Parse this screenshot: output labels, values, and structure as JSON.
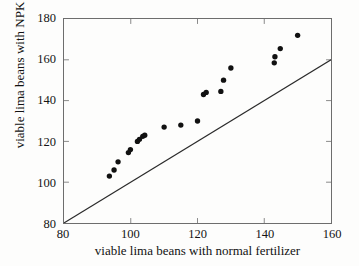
{
  "chart_data": {
    "type": "scatter",
    "title": "",
    "xlabel": "viable lima beans with normal fertilizer",
    "ylabel": "viable lima beans with NPK fertilizer",
    "xlim": [
      80,
      160
    ],
    "ylim": [
      80,
      180
    ],
    "xticks": [
      80,
      100,
      120,
      140,
      160
    ],
    "yticks": [
      80,
      100,
      120,
      140,
      160,
      180
    ],
    "grid": false,
    "legend": null,
    "marker": {
      "shape": "circle",
      "color": "#111111",
      "size": 5.4
    },
    "series": [
      {
        "name": "paired lima bean counts",
        "points": [
          [
            93.6,
            103.0
          ],
          [
            95.0,
            106.0
          ],
          [
            96.2,
            110.0
          ],
          [
            99.3,
            114.5
          ],
          [
            99.9,
            116.0
          ],
          [
            102.0,
            120.0
          ],
          [
            102.6,
            121.0
          ],
          [
            103.6,
            122.5
          ],
          [
            104.2,
            123.0
          ],
          [
            110.0,
            127.0
          ],
          [
            115.0,
            128.0
          ],
          [
            120.0,
            130.0
          ],
          [
            121.8,
            143.0
          ],
          [
            122.6,
            144.0
          ],
          [
            127.0,
            144.5
          ],
          [
            127.8,
            150.0
          ],
          [
            130.0,
            156.0
          ],
          [
            143.0,
            158.5
          ],
          [
            143.2,
            161.5
          ],
          [
            144.8,
            165.5
          ],
          [
            150.0,
            172.0
          ]
        ]
      }
    ],
    "reference_line": {
      "label": "y = x identity line",
      "from": [
        80,
        80
      ],
      "to": [
        160,
        160
      ],
      "color": "#2b2b2b",
      "width": 1.1
    }
  }
}
